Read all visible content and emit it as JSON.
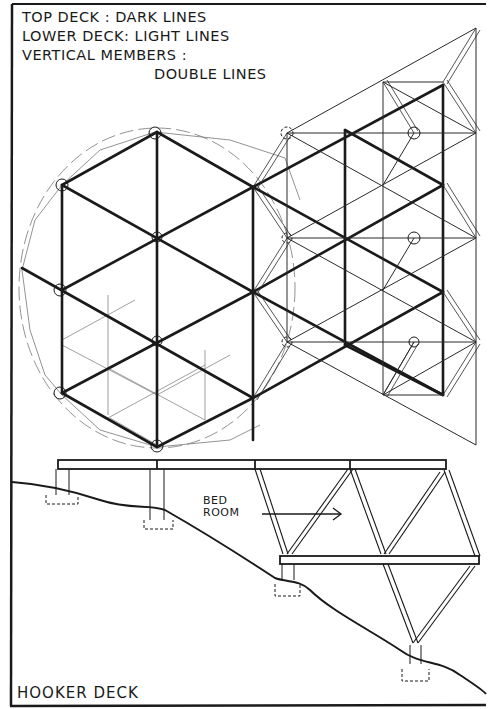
{
  "legend": {
    "line1": "TOP DECK : DARK LINES",
    "line2": "LOWER DECK: LIGHT LINES",
    "line3": "VERTICAL MEMBERS :",
    "line4": "DOUBLE LINES"
  },
  "elevation": {
    "room_label_line1": "BED",
    "room_label_line2": "ROOM"
  },
  "title": "HOOKER DECK",
  "colors": {
    "ink": "#1a1a1a",
    "light_ink": "#555555",
    "paper": "#ffffff"
  }
}
